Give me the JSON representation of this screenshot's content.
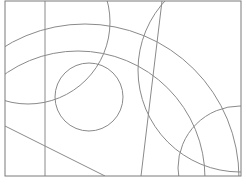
{
  "diagram": {
    "width": 246,
    "height": 184,
    "background": "#ffffff",
    "stroke_color": "#8a8a8a",
    "frame_color": "#7a7a7a",
    "frame": {
      "x": 5,
      "y": 1,
      "width": 236,
      "height": 175
    },
    "lines": [
      {
        "name": "vertical-line",
        "x1": 45,
        "y1": 1,
        "x2": 45,
        "y2": 176
      },
      {
        "name": "slanted-line",
        "x1": 162,
        "y1": 1,
        "x2": 141,
        "y2": 176
      },
      {
        "name": "diagonal-line",
        "x1": 5,
        "y1": 126,
        "x2": 105,
        "y2": 176
      }
    ],
    "circles": [
      {
        "name": "small-circle",
        "cx": 89,
        "cy": 97,
        "r": 34
      },
      {
        "name": "outer-large-arc",
        "cx": 85,
        "cy": 178,
        "r": 154
      },
      {
        "name": "inner-large-arc",
        "cx": 78,
        "cy": 178,
        "r": 127
      },
      {
        "name": "top-left-circle",
        "cx": 28,
        "cy": 22,
        "r": 82
      },
      {
        "name": "top-right-arc-circle",
        "cx": 240,
        "cy": 70,
        "r": 102
      },
      {
        "name": "bottom-right-circle",
        "cx": 240,
        "cy": 168,
        "r": 62
      }
    ]
  }
}
